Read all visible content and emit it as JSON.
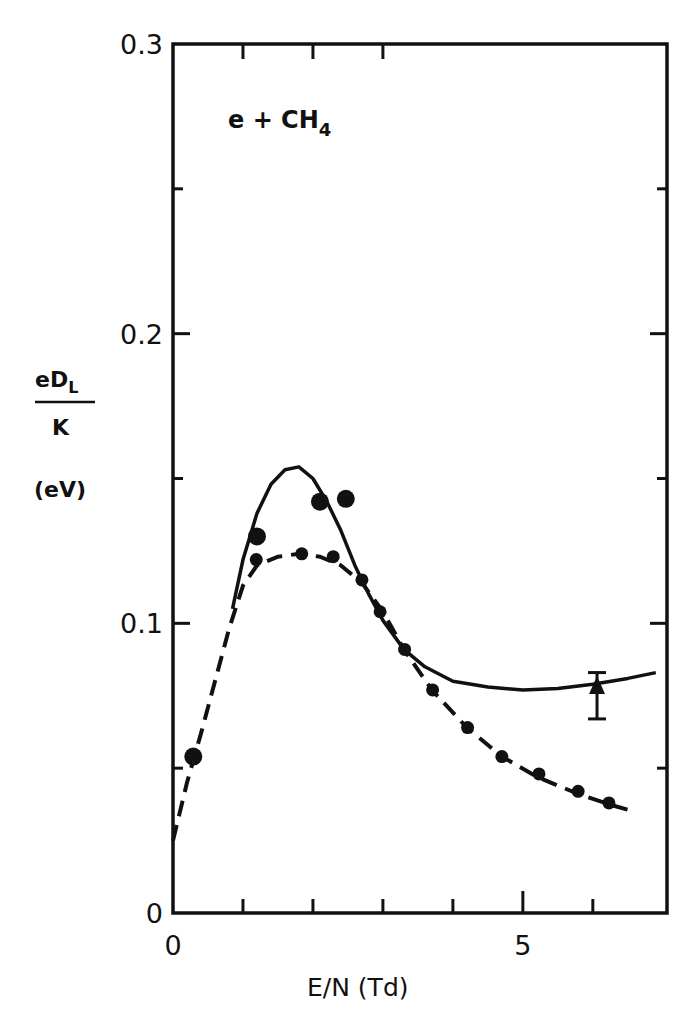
{
  "chart_data": {
    "type": "line",
    "title": "",
    "annotation": {
      "text": "e + CH",
      "subscript": "4"
    },
    "xlabel": "E/N (Td)",
    "ylabel": {
      "numerator": "eD",
      "numerator_sub": "L",
      "denominator": "K",
      "units": "(eV)"
    },
    "xlim": [
      0,
      7.06
    ],
    "ylim": [
      0,
      0.3
    ],
    "x_ticks": [
      0,
      1,
      2,
      3,
      4,
      5,
      6
    ],
    "x_tick_labels": [
      {
        "value": 0,
        "label": "0"
      },
      {
        "value": 5,
        "label": "5"
      }
    ],
    "y_ticks": [
      0,
      0.05,
      0.1,
      0.15,
      0.2,
      0.25,
      0.3
    ],
    "y_tick_labels": [
      {
        "value": 0,
        "label": "0"
      },
      {
        "value": 0.1,
        "label": "0.1"
      },
      {
        "value": 0.2,
        "label": "0.2"
      },
      {
        "value": 0.3,
        "label": "0.3"
      }
    ],
    "grid": false,
    "legend": null,
    "series": [
      {
        "name": "solid curve",
        "style": "solid",
        "x": [
          0.85,
          1.0,
          1.2,
          1.4,
          1.6,
          1.8,
          2.0,
          2.2,
          2.4,
          2.6,
          2.8,
          3.0,
          3.3,
          3.6,
          4.0,
          4.5,
          5.0,
          5.5,
          6.0,
          6.5,
          6.9
        ],
        "y": [
          0.105,
          0.122,
          0.138,
          0.148,
          0.153,
          0.154,
          0.15,
          0.142,
          0.132,
          0.12,
          0.11,
          0.101,
          0.091,
          0.085,
          0.08,
          0.078,
          0.077,
          0.0775,
          0.079,
          0.081,
          0.083
        ]
      },
      {
        "name": "dashed curve",
        "style": "dashed",
        "x": [
          0.0,
          0.2,
          0.4,
          0.6,
          0.8,
          1.0,
          1.2,
          1.5,
          1.8,
          2.1,
          2.4,
          2.7,
          3.0,
          3.3,
          3.7,
          4.2,
          4.7,
          5.2,
          5.8,
          6.3,
          6.6
        ],
        "y": [
          0.025,
          0.045,
          0.062,
          0.08,
          0.098,
          0.113,
          0.12,
          0.123,
          0.124,
          0.123,
          0.12,
          0.114,
          0.104,
          0.091,
          0.077,
          0.064,
          0.054,
          0.047,
          0.041,
          0.037,
          0.035
        ]
      },
      {
        "name": "small dots (on dashed curve)",
        "style": "marker-small",
        "x": [
          1.19,
          1.84,
          2.29,
          2.7,
          2.96,
          3.31,
          3.71,
          4.21,
          4.7,
          5.23,
          5.79,
          6.23
        ],
        "y": [
          0.122,
          0.124,
          0.123,
          0.115,
          0.104,
          0.091,
          0.077,
          0.064,
          0.054,
          0.048,
          0.042,
          0.038
        ]
      },
      {
        "name": "large dots",
        "style": "marker-large",
        "x": [
          0.29,
          1.2,
          2.1,
          2.47
        ],
        "y": [
          0.054,
          0.13,
          0.142,
          0.143
        ]
      },
      {
        "name": "triangle with error bar",
        "style": "triangle",
        "x": [
          6.06
        ],
        "y": [
          0.078
        ],
        "error_low": [
          0.067
        ],
        "error_high": [
          0.083
        ]
      }
    ]
  }
}
